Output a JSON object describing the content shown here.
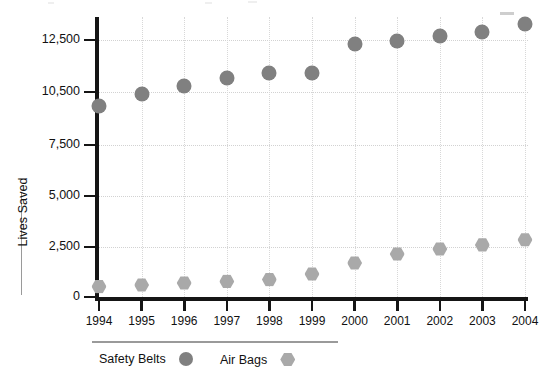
{
  "chart_data": {
    "type": "scatter",
    "title": "",
    "xlabel": "",
    "ylabel": "Lives Saved",
    "categories": [
      "1994",
      "1995",
      "1996",
      "1997",
      "1998",
      "1999",
      "2000",
      "2001",
      "2002",
      "2003",
      "2004"
    ],
    "y_ticks": [
      0,
      2500,
      5000,
      7500,
      10500,
      12500
    ],
    "y_tick_labels": [
      "0",
      "2,500",
      "5,000",
      "7,500",
      "10,500",
      "12,500"
    ],
    "ylim": [
      0,
      13500
    ],
    "grid": "dotted-both",
    "legend_position": "bottom-left",
    "series": [
      {
        "name": "Safety Belts",
        "marker": "circle",
        "color": "#808080",
        "values": [
          9700,
          10400,
          10750,
          11050,
          11250,
          11250,
          12350,
          12450,
          12650,
          12800,
          13100
        ]
      },
      {
        "name": "Air Bags",
        "marker": "hexagon",
        "color": "#a9a9a9",
        "values": [
          520,
          600,
          700,
          780,
          870,
          1150,
          1700,
          2150,
          2400,
          2600,
          2850
        ]
      }
    ]
  },
  "axis": {
    "y_title": "Lives Saved"
  },
  "legend": {
    "items": [
      {
        "label": "Safety Belts",
        "swatch": "circle-marker-icon",
        "color": "#808080"
      },
      {
        "label": "Air Bags",
        "swatch": "hexagon-marker-icon",
        "color": "#a9a9a9"
      }
    ]
  }
}
